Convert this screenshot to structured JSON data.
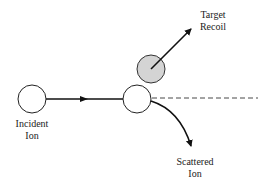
{
  "diagram": {
    "colors": {
      "line": "#111111",
      "circle_stroke": "#222222",
      "circle_fill": "#ffffff",
      "target_fill": "#d4d4d4",
      "background": "#ffffff"
    },
    "nodes": [
      {
        "id": "incident-ion",
        "label_lines": [
          "Incident",
          "Ion"
        ],
        "cx": 32,
        "cy": 99,
        "r": 14,
        "fill": "#ffffff"
      },
      {
        "id": "collision-ion",
        "label_lines": [],
        "cx": 137,
        "cy": 99,
        "r": 14,
        "fill": "#ffffff"
      },
      {
        "id": "target-atom",
        "label_lines": [],
        "cx": 151,
        "cy": 69,
        "r": 14,
        "fill": "#d4d4d4"
      }
    ],
    "edges": [
      {
        "id": "incident-path",
        "from": "incident-ion",
        "to": "collision-ion",
        "style": "solid",
        "arrow": "mid"
      },
      {
        "id": "original-direction",
        "from": "collision-ion",
        "to": "right-edge",
        "style": "dashed",
        "arrow": "none"
      },
      {
        "id": "recoil-path",
        "from": "target-atom",
        "to": "target-recoil-label",
        "style": "solid",
        "arrow": "end"
      },
      {
        "id": "scattered-path",
        "from": "collision-ion",
        "to": "scattered-ion-label",
        "style": "solid-curved",
        "arrow": "end"
      }
    ],
    "labels": {
      "target_recoil": {
        "line1": "Target",
        "line2": "Recoil"
      },
      "incident_ion": {
        "line1": "Incident",
        "line2": "Ion"
      },
      "scattered_ion": {
        "line1": "Scattered",
        "line2": "Ion"
      }
    }
  }
}
